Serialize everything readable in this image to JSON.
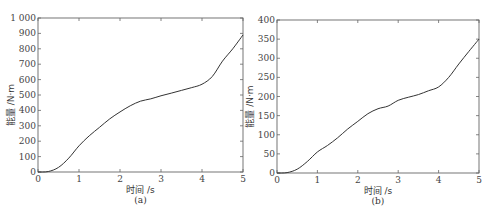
{
  "chart_data": [
    {
      "type": "line",
      "panel": "(a)",
      "title": "",
      "xlabel": "时间 /s",
      "ylabel": "能量 /N·m",
      "xlim": [
        0,
        5
      ],
      "ylim": [
        0,
        1000
      ],
      "xticks": [
        0,
        1,
        2,
        3,
        4,
        5
      ],
      "yticks": [
        0,
        100,
        200,
        300,
        400,
        500,
        600,
        700,
        800,
        900,
        1000
      ],
      "ytick_labels": [
        "0",
        "100",
        "200",
        "300",
        "400",
        "500",
        "600",
        "700",
        "800",
        "900",
        "1 000"
      ],
      "grid": false,
      "x": [
        0,
        0.25,
        0.5,
        0.75,
        1.0,
        1.25,
        1.5,
        1.75,
        2.0,
        2.25,
        2.5,
        2.75,
        3.0,
        3.25,
        3.5,
        3.75,
        4.0,
        4.25,
        4.5,
        4.75,
        5.0
      ],
      "values": [
        0,
        3,
        30,
        90,
        170,
        235,
        290,
        345,
        390,
        430,
        460,
        475,
        495,
        512,
        530,
        548,
        570,
        620,
        720,
        800,
        890
      ]
    },
    {
      "type": "line",
      "panel": "(b)",
      "title": "",
      "xlabel": "时间 /s",
      "ylabel": "能量 /N·m",
      "xlim": [
        0,
        5
      ],
      "ylim": [
        0,
        400
      ],
      "xticks": [
        0,
        1,
        2,
        3,
        4,
        5
      ],
      "yticks": [
        0,
        50,
        100,
        150,
        200,
        250,
        300,
        350,
        400
      ],
      "ytick_labels": [
        "0",
        "50",
        "100",
        "150",
        "200",
        "250",
        "300",
        "350",
        "400"
      ],
      "grid": false,
      "x": [
        0,
        0.25,
        0.5,
        0.75,
        1.0,
        1.25,
        1.5,
        1.75,
        2.0,
        2.25,
        2.5,
        2.75,
        3.0,
        3.25,
        3.5,
        3.75,
        4.0,
        4.25,
        4.5,
        4.75,
        5.0
      ],
      "values": [
        0,
        1,
        10,
        30,
        55,
        72,
        92,
        115,
        135,
        155,
        168,
        175,
        190,
        198,
        205,
        215,
        225,
        250,
        285,
        318,
        350
      ]
    }
  ],
  "layout": {
    "panels": [
      {
        "left": 38,
        "right": 243,
        "top": 18,
        "bottom": 172
      },
      {
        "left": 277,
        "right": 479,
        "top": 20,
        "bottom": 173
      }
    ]
  }
}
